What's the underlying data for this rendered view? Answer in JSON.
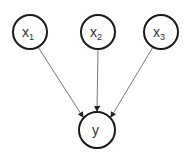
{
  "diagram": {
    "type": "directed-graph",
    "nodes": [
      {
        "id": "x1",
        "base": "x",
        "sub": "1",
        "cx": 30,
        "cy": 32,
        "r": 17
      },
      {
        "id": "x2",
        "base": "x",
        "sub": "2",
        "cx": 98,
        "cy": 32,
        "r": 17
      },
      {
        "id": "x3",
        "base": "x",
        "sub": "3",
        "cx": 161,
        "cy": 32,
        "r": 17
      },
      {
        "id": "y",
        "base": "y",
        "sub": "",
        "cx": 97,
        "cy": 130,
        "r": 18
      }
    ],
    "edges": [
      {
        "from": "x1",
        "to": "y"
      },
      {
        "from": "x2",
        "to": "y"
      },
      {
        "from": "x3",
        "to": "y"
      }
    ],
    "colors": {
      "node_stroke": "#1a1a1a",
      "edge": "#777777",
      "text": "#333333"
    }
  }
}
